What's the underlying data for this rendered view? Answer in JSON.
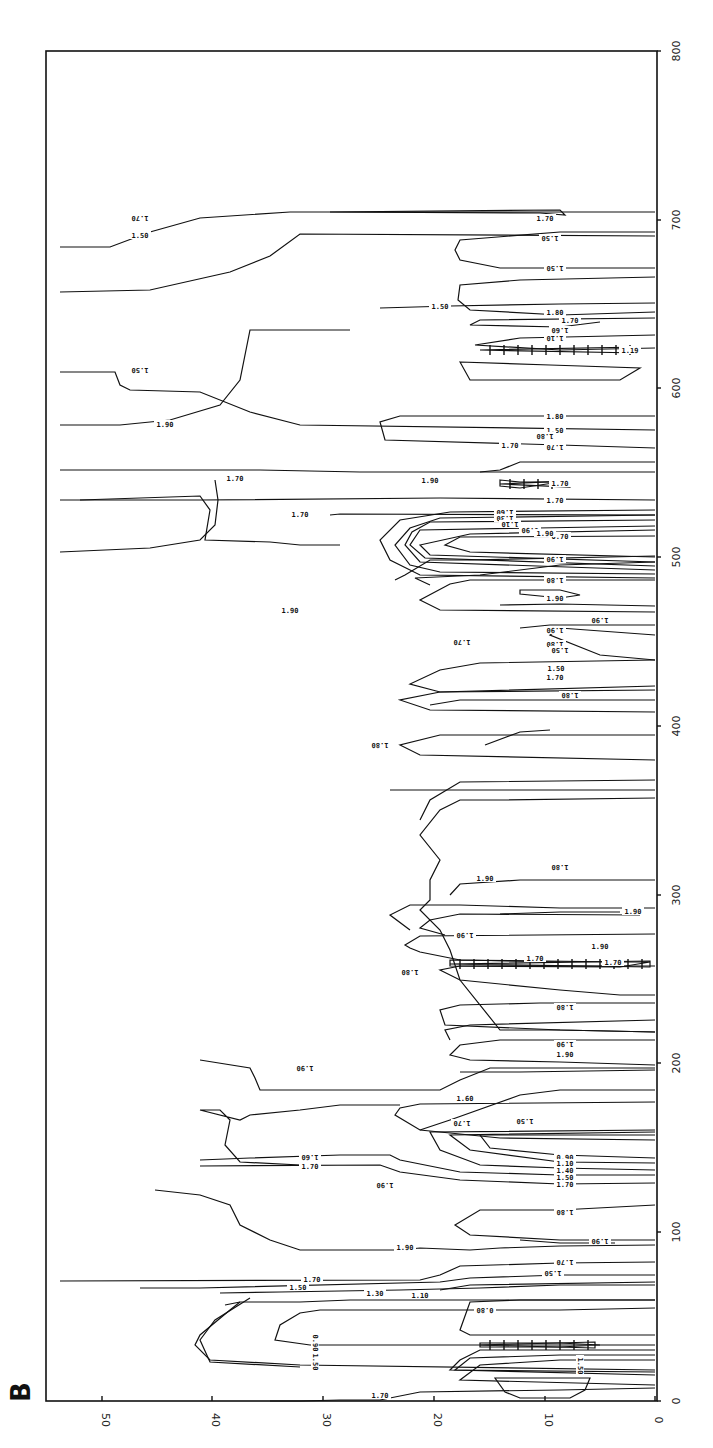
{
  "panel_label": "B",
  "chart_data": {
    "type": "contour",
    "title": "",
    "orientation": "rotated 90° (depth axis along bottom, reversed; distance axis along right)",
    "xlabel": "",
    "ylabel": "",
    "depth_axis": {
      "ticks": [
        50,
        40,
        30,
        20,
        10,
        0
      ],
      "tick_px": [
        102,
        212,
        323,
        434,
        545,
        655
      ],
      "range": [
        50,
        0
      ]
    },
    "distance_axis": {
      "ticks": [
        0,
        100,
        200,
        300,
        400,
        500,
        600,
        700,
        800
      ],
      "range": [
        0,
        800
      ]
    },
    "contour_levels": [
      0.5,
      0.7,
      0.8,
      0.9,
      1.1,
      1.3,
      1.5,
      1.6,
      1.7,
      1.8,
      1.9
    ],
    "grid": false,
    "legend": null,
    "contours": [
      {
        "level": "1.70",
        "d": "M60,247 L110,247 L150,232 L200,218 L290,212 L655,212"
      },
      {
        "level": "1.50",
        "d": "M60,292 L150,290 L230,272 L270,256 L300,234 L655,236"
      },
      {
        "level": "1.70",
        "d": "M330,212 L560,210 L565,215 L540,213 Z"
      },
      {
        "level": "1.50",
        "d": "M655,232 L560,232 L460,240 L455,250 L460,260 L500,268 L560,268 L655,268"
      },
      {
        "level": "1.80",
        "d": "M655,277 L520,280 L460,285 L458,300 L470,310 L560,315 L655,312"
      },
      {
        "level": "1.50",
        "d": "M380,308 L450,306 L560,304 L655,303"
      },
      {
        "level": "1.70",
        "d": "M655,318 L480,320 L470,325 L560,327 L600,322"
      },
      {
        "level": "1.30",
        "d": "M655,335 L520,338 L475,345 L560,350 L655,348"
      },
      {
        "level": "1.10",
        "d": "M460,362 L550,365 L640,368 L620,380 L470,380 Z"
      },
      {
        "level": "1.50",
        "d": "M60,372 L115,372 L120,385 L130,390 L200,392 L250,412 L300,425 L655,430"
      },
      {
        "level": "1.80",
        "d": "M655,416 L400,416 L380,422 L385,440 L560,445 L655,448"
      },
      {
        "level": "1.70",
        "d": "M655,462 L560,462 L520,462 L500,470 L480,472"
      },
      {
        "level": "1.70",
        "d": "M60,470 L180,470 L260,470 L360,472 L655,472"
      },
      {
        "level": "1.70",
        "d": "M500,480 L520,482 L560,482 L520,488 L500,486 Z"
      },
      {
        "level": "1.70",
        "d": "M60,500 L200,500 L440,498 L655,500"
      },
      {
        "level": "1.60",
        "d": "M655,510 L450,512 L400,520 L380,540 L390,560 L420,575 L655,578"
      },
      {
        "level": "1.30",
        "d": "M655,515 L440,518 L410,528 L395,545 L410,565 L440,572 L655,574"
      },
      {
        "level": "1.10",
        "d": "M655,520 L430,522 L412,532 L405,545 L420,562 L655,570"
      },
      {
        "level": "0.90",
        "d": "M655,526 L420,530 L410,545 L425,558 L655,566"
      },
      {
        "level": "0.70",
        "d": "M655,530 L470,534 L420,545 L430,555 L655,562"
      },
      {
        "level": "0.50",
        "d": "M655,536 L460,537 L445,545 L470,552 L655,557"
      },
      {
        "level": "1.70",
        "d": "M655,515 L340,514 L330,515"
      },
      {
        "level": "1.70",
        "d": "M80,500 L200,496 L210,510 L205,540 L270,542 L300,545 L340,545"
      },
      {
        "level": "1.80",
        "d": "M655,556 L470,560 L430,560 L405,575 L395,580"
      },
      {
        "level": "1.90",
        "d": "M60,552 L150,548 L200,540 L215,525 L218,500 L215,480"
      },
      {
        "level": "1.90",
        "d": "M655,562 L560,565 L480,575 L415,578 L430,585"
      },
      {
        "level": "1.90",
        "d": "M655,580 L470,580 L450,584 L420,600 L440,610 L655,612"
      },
      {
        "level": "1.90",
        "d": "M60,425 L120,425 L170,420 L220,405 L240,380 L250,330 L350,330"
      },
      {
        "level": "1.90",
        "d": "M655,606 L560,604 L500,605"
      },
      {
        "level": "1.90",
        "d": "M520,590 L560,590 L580,595 L560,598 L520,594 Z"
      },
      {
        "level": "1.90",
        "d": "M655,635 L560,628 L550,635 L600,655 L655,660"
      },
      {
        "level": "1.80",
        "d": "M655,660 L480,663 L440,670 L410,684 L440,692 L655,686"
      },
      {
        "level": "1.70",
        "d": "M655,690 L440,692 L400,700 L430,710 L655,712"
      },
      {
        "level": "1.70",
        "d": "M655,735 L440,735 L400,745 L420,755 L655,760"
      },
      {
        "level": "1.90",
        "d": "M550,730 L520,732 L485,745"
      },
      {
        "level": "1.90",
        "d": "M655,790 L440,790 L390,790"
      },
      {
        "level": "1.80",
        "d": "M655,798 L500,800 L460,800 L440,810 L420,835 L440,860 L430,880 L430,900 L420,910 L440,930 L450,950 L460,980 L500,1030 L560,1030 L655,1032"
      },
      {
        "level": "1.90",
        "d": "M655,780 L460,782 L430,800 L420,820"
      },
      {
        "level": "1.70",
        "d": "M655,625 L550,625 L520,628"
      },
      {
        "level": "1.50",
        "d": "M655,700 L460,700 L430,705"
      },
      {
        "level": "1.90",
        "d": "M655,1040 L500,1040 L460,1045 L450,1055 L470,1060 L560,1062 L655,1065"
      },
      {
        "level": "1.90",
        "d": "M655,1070 L520,1072 L460,1072"
      },
      {
        "level": "1.80",
        "d": "M655,1020 L470,1025 L445,1030 L450,1040"
      },
      {
        "level": "1.90",
        "d": "M655,1068 L490,1068 L460,1080 L440,1090 L400,1090 L310,1090 L260,1090 L255,1078 L250,1068 L200,1060"
      },
      {
        "level": "1.90",
        "d": "M655,966 L560,966 L460,966 L440,970 L460,980 L560,990 L620,995 L655,995"
      },
      {
        "level": "1.80",
        "d": "M655,1003 L540,1003 L460,1005 L440,1010 L445,1025 L560,1030 L655,1032"
      },
      {
        "level": "1.80",
        "d": "M655,934 L420,936 L405,945 L410,948 L420,952 L460,960 L560,962"
      },
      {
        "level": "1.90",
        "d": "M640,915 L460,914 L430,920 L420,928 L445,935"
      },
      {
        "level": "1.70",
        "d": "M450,960 L620,962 L650,962 L620,967 L450,966 Z"
      },
      {
        "level": "1.80",
        "d": "M655,908 L560,908 L460,905 L410,905 L390,915 L410,930"
      },
      {
        "level": "1.90",
        "d": "M655,880 L520,880 L460,884 L450,895"
      },
      {
        "level": "1.90",
        "d": "M620,912 L560,912 L500,914"
      },
      {
        "level": "1.50",
        "d": "M655,1102 L420,1104 L400,1108 L395,1115 L420,1130 L500,1138 L655,1140"
      },
      {
        "level": "1.60",
        "d": "M655,1090 L560,1090 L520,1095 L450,1120 L420,1130"
      },
      {
        "level": "0.90",
        "d": "M655,1135 L480,1135 L490,1148 L560,1155 L655,1158"
      },
      {
        "level": "1.10",
        "d": "M655,1132 L450,1135 L470,1150 L560,1162 L655,1163"
      },
      {
        "level": "1.40",
        "d": "M655,1130 L430,1132 L440,1150 L480,1165 L560,1168 L655,1170"
      },
      {
        "level": "1.50",
        "d": "M655,1175 L560,1175 L460,1172 L400,1160 L390,1155 L340,1155 L250,1158 L200,1160"
      },
      {
        "level": "1.70",
        "d": "M655,1183 L560,1184 L460,1180 L400,1172 L380,1165 L200,1166"
      },
      {
        "level": "1.70",
        "d": "M400,1105 L340,1105 L300,1110 L250,1115 L240,1120 L200,1110 L220,1110 L230,1120 L225,1145 L240,1162 L300,1165"
      },
      {
        "level": "1.80",
        "d": "M655,1205 L560,1210 L480,1210 L455,1225 L470,1235 L560,1240 L655,1240"
      },
      {
        "level": "1.90",
        "d": "M655,1245 L560,1246 L500,1248 L470,1250 L420,1248 L400,1250 L300,1250 L270,1240 L240,1225 L230,1205 L200,1195 L155,1190"
      },
      {
        "level": "1.90",
        "d": "M615,1243 L560,1243 L520,1240"
      },
      {
        "level": "1.70",
        "d": "M655,1262 L560,1263 L460,1266 L440,1275 L420,1280 L60,1281"
      },
      {
        "level": "1.50",
        "d": "M655,1275 L560,1275 L470,1278 L440,1282 L200,1288 L140,1288"
      },
      {
        "level": "1.10",
        "d": "M655,1285 L560,1285 L480,1288 L400,1290 L280,1292 L220,1293"
      },
      {
        "level": "1.30",
        "d": "M655,1282 L470,1285 L440,1290"
      },
      {
        "level": "0.80",
        "d": "M655,1308 L560,1310 L480,1310 L400,1310 L320,1310 L300,1313 L280,1325 L275,1340 L310,1345 L655,1345"
      },
      {
        "level": "1.50",
        "d": "M225,1305 L240,1302 L300,1302 L350,1300 L655,1300"
      },
      {
        "level": "1.70",
        "d": "M240,1302 L230,1310 L200,1335 L195,1345 L210,1360 L300,1365 L655,1370"
      },
      {
        "level": "1.90",
        "d": "M250,1298 L215,1320 L200,1340 L210,1362 L300,1367"
      },
      {
        "level": "1.70",
        "d": "M655,1300 L520,1300 L470,1302 L460,1330 L470,1335 L655,1335"
      },
      {
        "level": "1.10",
        "d": "M480,1343 L560,1343 L600,1345 L560,1347 L480,1347 Z"
      },
      {
        "level": "0.90",
        "d": "M655,1350 L560,1350 L480,1350 L460,1360 L450,1370 L655,1372"
      },
      {
        "level": "0.70",
        "d": "M655,1355 L560,1355 L470,1358 L455,1370 L655,1375"
      },
      {
        "level": "0.50",
        "d": "M655,1360 L560,1360 L480,1365 L460,1380 L655,1385"
      },
      {
        "level": "1.70",
        "d": "M655,1388 L560,1390 L420,1392 L380,1400 L340,1400 L300,1401 L270,1401"
      },
      {
        "level": "0.80",
        "d": "M495,1378 L590,1378 L585,1390 L570,1398 L520,1398 L505,1392 Z"
      }
    ],
    "labels": [
      {
        "text": "1.70",
        "x": 140,
        "y": 218,
        "rot": 180
      },
      {
        "text": "1.50",
        "x": 140,
        "y": 235,
        "rot": 0
      },
      {
        "text": "1.70",
        "x": 545,
        "y": 218,
        "rot": 0
      },
      {
        "text": "1.50",
        "x": 550,
        "y": 238,
        "rot": 180
      },
      {
        "text": "1.50",
        "x": 555,
        "y": 268,
        "rot": 180
      },
      {
        "text": "1.80",
        "x": 555,
        "y": 312,
        "rot": 0
      },
      {
        "text": "1.50",
        "x": 440,
        "y": 306,
        "rot": 0
      },
      {
        "text": "1.70",
        "x": 570,
        "y": 320,
        "rot": 0
      },
      {
        "text": "1.60",
        "x": 560,
        "y": 330,
        "rot": 180
      },
      {
        "text": "1.10",
        "x": 555,
        "y": 338,
        "rot": 180
      },
      {
        "text": "1.19",
        "x": 630,
        "y": 350,
        "rot": 0
      },
      {
        "text": "1.50",
        "x": 140,
        "y": 370,
        "rot": 180
      },
      {
        "text": "1.80",
        "x": 555,
        "y": 416,
        "rot": 0
      },
      {
        "text": "1.50",
        "x": 555,
        "y": 430,
        "rot": 0
      },
      {
        "text": "1.70",
        "x": 555,
        "y": 447,
        "rot": 180
      },
      {
        "text": "1.70",
        "x": 235,
        "y": 478,
        "rot": 0
      },
      {
        "text": "1.70",
        "x": 560,
        "y": 483,
        "rot": 0
      },
      {
        "text": "1.70",
        "x": 555,
        "y": 500,
        "rot": 0
      },
      {
        "text": "1.60",
        "x": 505,
        "y": 512,
        "rot": 180
      },
      {
        "text": "1.30",
        "x": 505,
        "y": 518,
        "rot": 180
      },
      {
        "text": "1.10",
        "x": 510,
        "y": 524,
        "rot": 180
      },
      {
        "text": "0.90",
        "x": 530,
        "y": 530,
        "rot": 180
      },
      {
        "text": "0.70",
        "x": 560,
        "y": 536,
        "rot": 0
      },
      {
        "text": "1.70",
        "x": 300,
        "y": 514,
        "rot": 0
      },
      {
        "text": "1.90",
        "x": 555,
        "y": 598,
        "rot": 0
      },
      {
        "text": "1.90",
        "x": 165,
        "y": 424,
        "rot": 0
      },
      {
        "text": "1.90",
        "x": 290,
        "y": 610,
        "rot": 0
      },
      {
        "text": "1.90",
        "x": 555,
        "y": 630,
        "rot": 180
      },
      {
        "text": "1.90",
        "x": 600,
        "y": 620,
        "rot": 180
      },
      {
        "text": "1.80",
        "x": 545,
        "y": 436,
        "rot": 180
      },
      {
        "text": "1.90",
        "x": 430,
        "y": 480,
        "rot": 0
      },
      {
        "text": "1.70",
        "x": 510,
        "y": 445,
        "rot": 0
      },
      {
        "text": "1.90",
        "x": 545,
        "y": 533,
        "rot": 0
      },
      {
        "text": "1.90",
        "x": 555,
        "y": 559,
        "rot": 180
      },
      {
        "text": "1.80",
        "x": 555,
        "y": 580,
        "rot": 180
      },
      {
        "text": "1.80",
        "x": 555,
        "y": 644,
        "rot": 180
      },
      {
        "text": "1.70",
        "x": 555,
        "y": 677,
        "rot": 0
      },
      {
        "text": "1.50",
        "x": 560,
        "y": 650,
        "rot": 180
      },
      {
        "text": "1.70",
        "x": 462,
        "y": 642,
        "rot": 180
      },
      {
        "text": "1.50",
        "x": 556,
        "y": 668,
        "rot": 0
      },
      {
        "text": "1.80",
        "x": 570,
        "y": 695,
        "rot": 180
      },
      {
        "text": "1.80",
        "x": 380,
        "y": 745,
        "rot": 180
      },
      {
        "text": "1.80",
        "x": 560,
        "y": 867,
        "rot": 180
      },
      {
        "text": "1.90",
        "x": 485,
        "y": 878,
        "rot": 0
      },
      {
        "text": "1.90",
        "x": 633,
        "y": 911,
        "rot": 0
      },
      {
        "text": "1.90",
        "x": 465,
        "y": 935,
        "rot": 180
      },
      {
        "text": "1.90",
        "x": 600,
        "y": 946,
        "rot": 0
      },
      {
        "text": "1.70",
        "x": 535,
        "y": 958,
        "rot": 0
      },
      {
        "text": "1.70",
        "x": 613,
        "y": 962,
        "rot": 0
      },
      {
        "text": "1.80",
        "x": 410,
        "y": 972,
        "rot": 180
      },
      {
        "text": "1.80",
        "x": 565,
        "y": 1007,
        "rot": 180
      },
      {
        "text": "1.90",
        "x": 565,
        "y": 1044,
        "rot": 180
      },
      {
        "text": "1.90",
        "x": 565,
        "y": 1054,
        "rot": 0
      },
      {
        "text": "1.90",
        "x": 305,
        "y": 1068,
        "rot": 180
      },
      {
        "text": "1.60",
        "x": 465,
        "y": 1098,
        "rot": 0
      },
      {
        "text": "1.70",
        "x": 462,
        "y": 1123,
        "rot": 180
      },
      {
        "text": "1.50",
        "x": 525,
        "y": 1121,
        "rot": 180
      },
      {
        "text": "1.60",
        "x": 310,
        "y": 1157,
        "rot": 180
      },
      {
        "text": "1.70",
        "x": 310,
        "y": 1166,
        "rot": 0
      },
      {
        "text": "0.90",
        "x": 565,
        "y": 1157,
        "rot": 0
      },
      {
        "text": "1.10",
        "x": 565,
        "y": 1163,
        "rot": 0
      },
      {
        "text": "1.40",
        "x": 565,
        "y": 1170,
        "rot": 0
      },
      {
        "text": "1.50",
        "x": 565,
        "y": 1177,
        "rot": 0
      },
      {
        "text": "1.70",
        "x": 565,
        "y": 1184,
        "rot": 0
      },
      {
        "text": "1.90",
        "x": 385,
        "y": 1185,
        "rot": 180
      },
      {
        "text": "1.80",
        "x": 565,
        "y": 1212,
        "rot": 180
      },
      {
        "text": "1.90",
        "x": 600,
        "y": 1241,
        "rot": 180
      },
      {
        "text": "1.90",
        "x": 405,
        "y": 1247,
        "rot": 0
      },
      {
        "text": "1.70",
        "x": 565,
        "y": 1262,
        "rot": 180
      },
      {
        "text": "1.50",
        "x": 553,
        "y": 1273,
        "rot": 180
      },
      {
        "text": "1.70",
        "x": 312,
        "y": 1279,
        "rot": 0
      },
      {
        "text": "1.50",
        "x": 298,
        "y": 1287,
        "rot": 0
      },
      {
        "text": "1.30",
        "x": 375,
        "y": 1293,
        "rot": 0
      },
      {
        "text": "1.10",
        "x": 420,
        "y": 1295,
        "rot": 0
      },
      {
        "text": "0.80",
        "x": 485,
        "y": 1310,
        "rot": 180
      },
      {
        "text": "0.90",
        "x": 315,
        "y": 1343,
        "rot": 90
      },
      {
        "text": "1.50",
        "x": 315,
        "y": 1362,
        "rot": 90
      },
      {
        "text": "1.70",
        "x": 380,
        "y": 1395,
        "rot": 0
      },
      {
        "text": "1.50",
        "x": 580,
        "y": 1366,
        "rot": 90
      }
    ],
    "hatched_minima": [
      {
        "x1": 480,
        "x2": 640,
        "y": 350,
        "level": "1.19"
      },
      {
        "x1": 500,
        "x2": 570,
        "y": 484,
        "level": "1.70"
      },
      {
        "x1": 450,
        "x2": 650,
        "y": 964,
        "level": "1.70"
      },
      {
        "x1": 480,
        "x2": 595,
        "y": 1345,
        "level": "1.10"
      }
    ]
  },
  "axes": {
    "bottom_ticks": [
      {
        "label": "50",
        "x": 102
      },
      {
        "label": "40",
        "x": 212
      },
      {
        "label": "30",
        "x": 323
      },
      {
        "label": "20",
        "x": 434
      },
      {
        "label": "10",
        "x": 545
      },
      {
        "label": "0",
        "x": 655
      }
    ],
    "right_ticks": [
      {
        "label": "0",
        "y": 1401
      },
      {
        "label": "100",
        "y": 1232
      },
      {
        "label": "200",
        "y": 1063
      },
      {
        "label": "300",
        "y": 895
      },
      {
        "label": "400",
        "y": 726
      },
      {
        "label": "500",
        "y": 557
      },
      {
        "label": "600",
        "y": 388
      },
      {
        "label": "700",
        "y": 220
      },
      {
        "label": "800",
        "y": 51
      }
    ]
  }
}
